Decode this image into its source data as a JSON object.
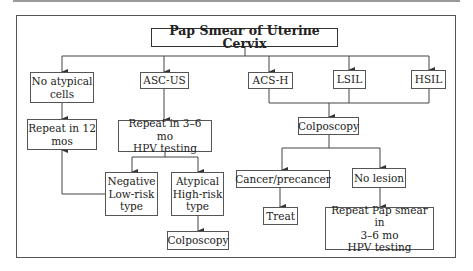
{
  "title": "Pap Smear of Uterine Cervix",
  "categories": {
    "no_atypical": "No atypical\ncells",
    "asc_us": "ASC-US",
    "acs_h": "ACS-H",
    "lsil": "LSIL",
    "hsil": "HSIL"
  },
  "left_branch": {
    "repeat_12": "Repeat in 12\nmos"
  },
  "asc_us_branch": {
    "repeat_hpv": "Repeat in 3–6 mo\nHPV testing",
    "negative": "Negative\nLow-risk\ntype",
    "atypical": "Atypical\nHigh-risk\ntype",
    "colposcopy": "Colposcopy"
  },
  "high_grade_branch": {
    "colposcopy": "Colposcopy",
    "cancer": "Cancer/precancer",
    "no_lesion": "No lesion",
    "treat": "Treat",
    "repeat_pap": "Repeat Pap smear in\n3–6 mo\nHPV testing"
  },
  "colors": {
    "line": "#444444",
    "border": "#555555",
    "background": "#ffffff"
  }
}
